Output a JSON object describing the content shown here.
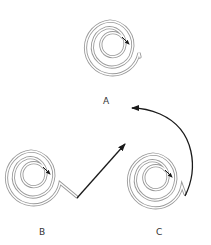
{
  "diagram": {
    "labels": {
      "a": "A",
      "b": "B",
      "c": "C"
    },
    "spirals": [
      {
        "id": "A",
        "center": [
          112,
          45
        ],
        "outer_radius": 27
      },
      {
        "id": "B",
        "center": [
          33,
          175
        ],
        "outer_radius": 27
      },
      {
        "id": "C",
        "center": [
          155,
          178
        ],
        "outer_radius": 28
      }
    ],
    "arrows": [
      {
        "from": "B",
        "to": "A",
        "shape": "straight"
      },
      {
        "from": "C",
        "to": "A",
        "shape": "curved"
      }
    ],
    "colors": {
      "spiral_stroke": "#9a9a9a",
      "arrow": "#1a1a1a",
      "label": "#333333",
      "background": "#ffffff"
    }
  }
}
